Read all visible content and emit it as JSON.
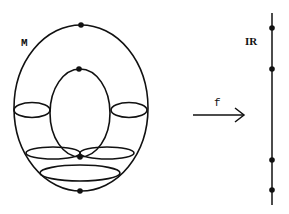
{
  "diagram": {
    "manifold_label": "M",
    "map_label": "f",
    "codomain_label": "IR",
    "stroke_color": "#111111",
    "background_color": "#ffffff",
    "critical_points_on_torus": [
      "top of outer circle",
      "top of inner circle",
      "bottom of inner circle",
      "bottom of outer circle"
    ],
    "critical_values_on_line": 4
  }
}
